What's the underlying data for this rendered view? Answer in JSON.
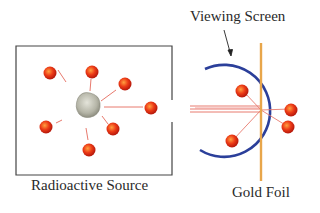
{
  "labels": {
    "source": "Radioactive Source",
    "screen": "Viewing Screen",
    "foil": "Gold Foil"
  },
  "colors": {
    "particle": "#e8301a",
    "particle_highlight": "#ff8a3a",
    "track": "#e87a6e",
    "screen_arc": "#2b3f9a",
    "foil": "#e8a64a",
    "box": "#444444",
    "nucleus": "#b8b8a8"
  }
}
